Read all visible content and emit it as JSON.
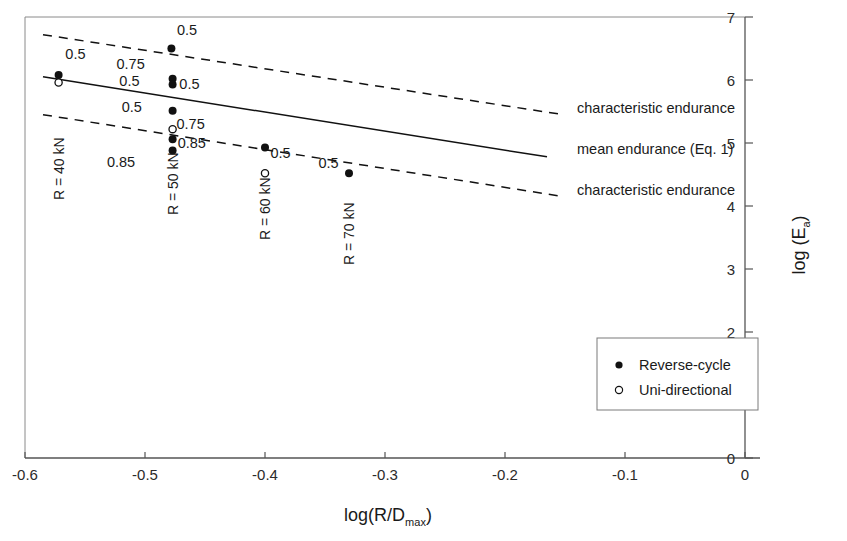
{
  "chart_data": {
    "type": "scatter",
    "title": "",
    "xlabel": "log(R/Dmax)",
    "ylabel": "log (Ea)",
    "xlim": [
      -0.6,
      0.0
    ],
    "ylim": [
      0,
      7
    ],
    "xticks": [
      "-0.6",
      "-0.5",
      "-0.4",
      "-0.3",
      "-0.2",
      "-0.1",
      "0"
    ],
    "xtick_values": [
      -0.6,
      -0.5,
      -0.4,
      -0.3,
      -0.2,
      -0.1,
      0
    ],
    "yticks": [
      "0",
      "1",
      "2",
      "3",
      "4",
      "5",
      "6",
      "7"
    ],
    "ytick_values": [
      0,
      1,
      2,
      3,
      4,
      5,
      6,
      7
    ],
    "grid": false,
    "y_axis_position": "right",
    "legend_position": "lower-right",
    "legend": [
      {
        "marker": "filled-circle",
        "label": "Reverse-cycle"
      },
      {
        "marker": "open-circle",
        "label": "Uni-directional"
      }
    ],
    "series": [
      {
        "name": "Reverse-cycle",
        "marker": "filled-circle",
        "points": [
          {
            "x": -0.572,
            "y": 6.08,
            "label": "0.5"
          },
          {
            "x": -0.478,
            "y": 6.5,
            "label": "0.5"
          },
          {
            "x": -0.477,
            "y": 6.02,
            "label": "0.75"
          },
          {
            "x": -0.477,
            "y": 5.93,
            "label": "0.5"
          },
          {
            "x": -0.477,
            "y": 5.51,
            "label": "0.5"
          },
          {
            "x": -0.477,
            "y": 5.06,
            "label": "0.75"
          },
          {
            "x": -0.477,
            "y": 4.88,
            "label": "0.85"
          },
          {
            "x": -0.4,
            "y": 4.93,
            "label": "0.5"
          },
          {
            "x": -0.33,
            "y": 4.52,
            "label": "0.5"
          }
        ]
      },
      {
        "name": "Uni-directional",
        "marker": "open-circle",
        "points": [
          {
            "x": -0.572,
            "y": 5.96,
            "label": ""
          },
          {
            "x": -0.477,
            "y": 5.22,
            "label": "0.85"
          },
          {
            "x": -0.4,
            "y": 4.52,
            "label": ""
          }
        ]
      }
    ],
    "lines": [
      {
        "name": "characteristic endurance (upper)",
        "style": "dashed",
        "x": [
          -0.585,
          -0.155
        ],
        "y": [
          6.72,
          5.46
        ]
      },
      {
        "name": "mean endurance (Eq. 1)",
        "style": "solid",
        "x": [
          -0.585,
          -0.165
        ],
        "y": [
          6.05,
          4.78
        ]
      },
      {
        "name": "characteristic endurance (lower)",
        "style": "dashed",
        "x": [
          -0.585,
          -0.155
        ],
        "y": [
          5.45,
          4.16
        ]
      }
    ],
    "line_annotations": [
      {
        "text": "characteristic endurance",
        "x": -0.14,
        "y": 5.47
      },
      {
        "text": "mean endurance (Eq. 1)",
        "x": -0.14,
        "y": 4.82
      },
      {
        "text": "characteristic endurance",
        "x": -0.14,
        "y": 4.17
      }
    ],
    "point_labels": [
      {
        "text": "0.5",
        "x": -0.558,
        "y": 6.33
      },
      {
        "text": "0.5",
        "x": -0.465,
        "y": 6.72
      },
      {
        "text": "0.75",
        "x": -0.512,
        "y": 6.18
      },
      {
        "text": "0.5",
        "x": -0.513,
        "y": 5.9
      },
      {
        "text": "0.5",
        "x": -0.463,
        "y": 5.86
      },
      {
        "text": "0.5",
        "x": -0.511,
        "y": 5.5
      },
      {
        "text": "0.75",
        "x": -0.462,
        "y": 5.22
      },
      {
        "text": "0.85",
        "x": -0.461,
        "y": 4.92
      },
      {
        "text": "0.85",
        "x": -0.52,
        "y": 4.62
      },
      {
        "text": "0.5",
        "x": -0.387,
        "y": 4.76
      },
      {
        "text": "0.5",
        "x": -0.347,
        "y": 4.6
      }
    ],
    "group_labels": [
      {
        "text": "R = 40 kN",
        "x": -0.572,
        "orientation": "vertical"
      },
      {
        "text": "R = 50 kN",
        "x": -0.477,
        "orientation": "vertical"
      },
      {
        "text": "R = 60 kN",
        "x": -0.4,
        "orientation": "vertical"
      },
      {
        "text": "R = 70 kN",
        "x": -0.33,
        "orientation": "vertical"
      }
    ]
  },
  "axis": {
    "x_title_main": "log(R/D",
    "x_title_sub": "max",
    "x_title_end": ")",
    "y_title_main": "log (E",
    "y_title_sub": "a",
    "y_title_end": ")"
  },
  "legend": {
    "items": [
      {
        "label": "Reverse-cycle"
      },
      {
        "label": "Uni-directional"
      }
    ]
  },
  "colors": {
    "axis": "#555555",
    "marker": "#111111",
    "line": "#111111",
    "background": "#ffffff"
  }
}
